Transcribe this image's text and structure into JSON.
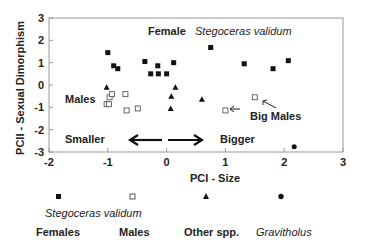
{
  "chart_data": {
    "type": "scatter",
    "title": "",
    "xlabel": "PCI - Size",
    "ylabel": "PCII - Sexual Dimorphism",
    "xlim": [
      -2,
      3
    ],
    "ylim": [
      -3,
      3
    ],
    "xticks": [
      -2,
      -1,
      0,
      1,
      2,
      3
    ],
    "yticks": [
      -3,
      -2,
      -1,
      0,
      1,
      2,
      3
    ],
    "grid": false,
    "legend_position": "bottom",
    "series": [
      {
        "name": "Stegoceras validum Females",
        "marker": "filled-square",
        "points": [
          [
            -1.0,
            1.45
          ],
          [
            -0.9,
            0.86
          ],
          [
            -0.83,
            0.73
          ],
          [
            -0.37,
            1.05
          ],
          [
            -0.27,
            0.5
          ],
          [
            -0.15,
            0.86
          ],
          [
            -0.14,
            0.5
          ],
          [
            0.0,
            0.5
          ],
          [
            0.12,
            1.0
          ],
          [
            0.75,
            1.68
          ],
          [
            1.32,
            0.95
          ],
          [
            1.81,
            0.73
          ],
          [
            2.07,
            1.09
          ]
        ]
      },
      {
        "name": "Stegoceras validum Males",
        "marker": "open-square",
        "points": [
          [
            -0.97,
            -0.55
          ],
          [
            -0.93,
            -0.41
          ],
          [
            -1.02,
            -0.86
          ],
          [
            -0.98,
            -0.86
          ],
          [
            -0.7,
            -0.41
          ],
          [
            -0.68,
            -1.14
          ],
          [
            -0.49,
            -1.05
          ],
          [
            1.0,
            -1.14
          ],
          [
            1.5,
            -0.55
          ]
        ]
      },
      {
        "name": "Other spp.",
        "marker": "filled-triangle",
        "points": [
          [
            -1.02,
            -0.1
          ],
          [
            0.15,
            -0.1
          ],
          [
            0.08,
            -0.5
          ],
          [
            0.07,
            -1.05
          ],
          [
            0.6,
            -0.64
          ]
        ]
      },
      {
        "name": "Gravitholus",
        "marker": "filled-circle",
        "points": [
          [
            2.17,
            -2.77
          ]
        ]
      }
    ],
    "annotations": [
      {
        "text": "Female",
        "style": "bold"
      },
      {
        "text": "Stegoceras validum",
        "style": "italic"
      },
      {
        "text": "Males",
        "style": "bold"
      },
      {
        "text": "Big Males",
        "style": "bold"
      },
      {
        "text": "Smaller",
        "style": "bold"
      },
      {
        "text": "Bigger",
        "style": "bold"
      }
    ]
  },
  "labels": {
    "female": "Female",
    "species": "Stegoceras validum",
    "males": "Males",
    "big_males": "Big Males",
    "smaller": "Smaller",
    "bigger": "Bigger",
    "xlabel": "PCI - Size",
    "ylabel": "PCII - Sexual Dimorphism"
  },
  "legend": {
    "species": "Stegoceras validum",
    "items": [
      "Females",
      "Males",
      "Other spp.",
      "Gravitholus"
    ]
  }
}
